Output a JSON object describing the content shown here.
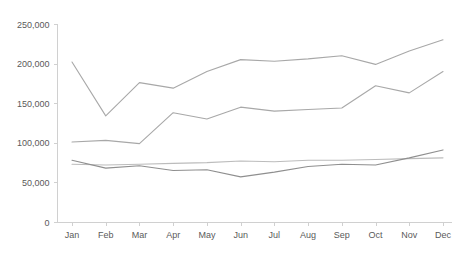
{
  "chart_data": {
    "type": "line",
    "title": "",
    "subtitle": "",
    "xlabel": "",
    "ylabel": "",
    "categories": [
      "Jan",
      "Feb",
      "Mar",
      "Apr",
      "May",
      "Jun",
      "Jul",
      "Aug",
      "Sep",
      "Oct",
      "Nov",
      "Dec"
    ],
    "ylim": [
      0,
      250000
    ],
    "y_ticks": [
      0,
      50000,
      100000,
      150000,
      200000,
      250000
    ],
    "y_tick_labels": [
      "0",
      "50,000",
      "100,000",
      "150,000",
      "200,000",
      "250,000"
    ],
    "grid": false,
    "legend": "none",
    "series": [
      {
        "name": "series-1",
        "color": "#a8a8a8",
        "values": [
          202000,
          134000,
          176000,
          169000,
          190000,
          205000,
          203000,
          206000,
          210000,
          199000,
          216000,
          230000
        ]
      },
      {
        "name": "series-2",
        "color": "#a8a8a8",
        "values": [
          101000,
          103000,
          99000,
          138000,
          130000,
          145000,
          140000,
          142000,
          144000,
          172000,
          163000,
          190000
        ]
      },
      {
        "name": "series-3",
        "color": "#bcbcbc",
        "values": [
          73000,
          72000,
          73000,
          74000,
          75000,
          77000,
          76000,
          78000,
          78000,
          79000,
          80000,
          81000
        ]
      },
      {
        "name": "series-4",
        "color": "#8f8f8f",
        "values": [
          78000,
          68000,
          71000,
          65000,
          66000,
          57000,
          63000,
          70000,
          73000,
          72000,
          81000,
          91000
        ]
      }
    ],
    "axis_color": "#d0d0d0",
    "label_color": "#5a5a5a",
    "background": "#ffffff"
  }
}
